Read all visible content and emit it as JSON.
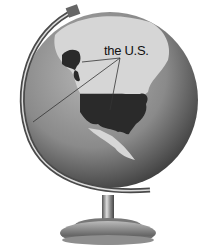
{
  "figure": {
    "label": "the U.S.",
    "pointer_targets": [
      "alaska",
      "contiguous-us",
      "hawaii"
    ],
    "colors": {
      "ocean": "#8a8a8a",
      "land": "#d8d8d8",
      "us_highlight": "#2a2a2a",
      "meridian": "#555555",
      "stand": "#7a7a7a",
      "label": "#111111"
    }
  }
}
